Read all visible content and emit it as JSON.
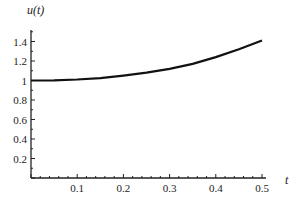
{
  "chart_data": {
    "type": "line",
    "title": "",
    "xlabel": "t",
    "ylabel": "u(t)",
    "xlim": [
      0,
      0.5
    ],
    "ylim": [
      0,
      1.5
    ],
    "grid": false,
    "legend": null,
    "x_ticks": [
      "0.1",
      "0.2",
      "0.3",
      "0.4",
      "0.5"
    ],
    "y_ticks": [
      "0.2",
      "0.4",
      "0.6",
      "0.8",
      "1",
      "1.2",
      "1.4"
    ],
    "series": [
      {
        "name": "u(t)",
        "x": [
          0,
          0.05,
          0.1,
          0.15,
          0.2,
          0.25,
          0.3,
          0.35,
          0.4,
          0.45,
          0.5
        ],
        "y": [
          1.0,
          1.002,
          1.01,
          1.025,
          1.05,
          1.08,
          1.12,
          1.17,
          1.24,
          1.32,
          1.41
        ]
      }
    ]
  }
}
